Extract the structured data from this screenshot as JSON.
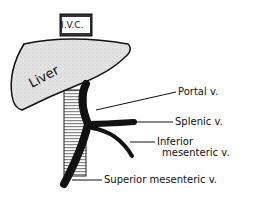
{
  "diagram": {
    "ivc_label": "I.V.C.",
    "liver_label": "Liver",
    "labels": {
      "portal": "Portal v.",
      "splenic": "Splenic v.",
      "inferior_1": "Inferior",
      "inferior_2": "mesenteric v.",
      "superior": "Superior mesenteric v."
    }
  }
}
